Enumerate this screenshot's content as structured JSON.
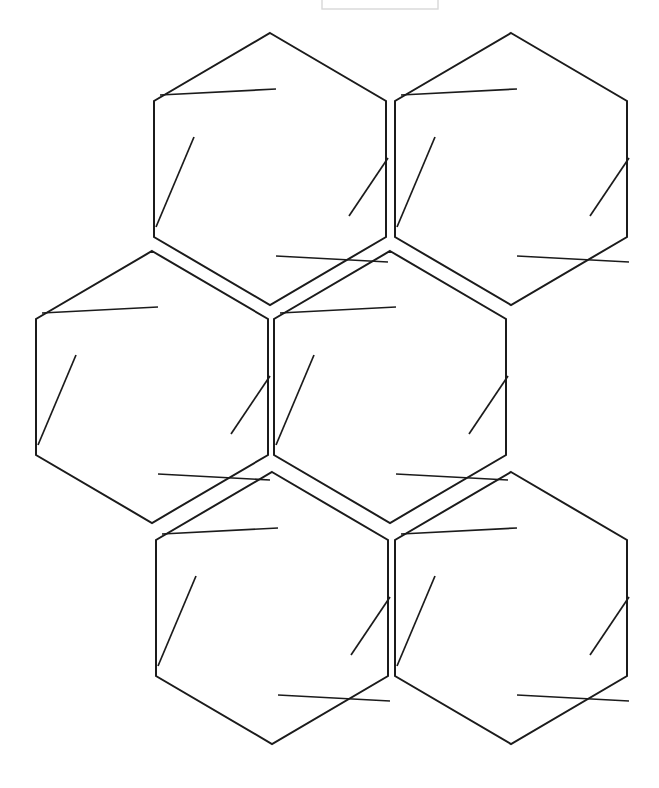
{
  "document": {
    "title": "Hexagon Grid Worksheet",
    "background_color": "#ffffff",
    "width": 659,
    "height": 788,
    "stroke_color": "#1b1b1b",
    "stroke_width": 2,
    "tick_stroke_width": 1.7
  },
  "header_box": {
    "label": "header-placeholder-box",
    "x": 322,
    "y": -6,
    "width": 116,
    "height": 15,
    "stroke_color": "#d8d8d8",
    "visible": true
  },
  "grid": {
    "type": "honeycomb",
    "orientation": "pointy-top",
    "hexagon_count": 6,
    "hex_width": 232,
    "hex_height": 272,
    "rows": 3,
    "row_labels": [
      "top-row",
      "middle-row",
      "bottom-row"
    ]
  },
  "hexagons": [
    {
      "id": "hex-1",
      "name": "hexagon-top-left",
      "row": 1,
      "column": 1,
      "cx": 270,
      "cy": 169,
      "rx": 116,
      "ry": 136,
      "ticks": [
        {
          "name": "tick-top-left-horizontal",
          "x1": 160,
          "y1": 95,
          "x2": 276,
          "y2": 89
        },
        {
          "name": "tick-left-diagonal",
          "x1": 156,
          "y1": 227,
          "x2": 194,
          "y2": 137
        },
        {
          "name": "tick-right-diagonal",
          "x1": 349,
          "y1": 216,
          "x2": 388,
          "y2": 158
        },
        {
          "name": "tick-bottom-horizontal",
          "x1": 276,
          "y1": 256,
          "x2": 388,
          "y2": 262
        }
      ]
    },
    {
      "id": "hex-2",
      "name": "hexagon-top-right",
      "row": 1,
      "column": 2,
      "cx": 511,
      "cy": 169,
      "rx": 116,
      "ry": 136,
      "ticks": [
        {
          "name": "tick-top-left-horizontal",
          "x1": 401,
          "y1": 95,
          "x2": 517,
          "y2": 89
        },
        {
          "name": "tick-left-diagonal",
          "x1": 397,
          "y1": 227,
          "x2": 435,
          "y2": 137
        },
        {
          "name": "tick-right-diagonal",
          "x1": 590,
          "y1": 216,
          "x2": 629,
          "y2": 158
        },
        {
          "name": "tick-bottom-horizontal",
          "x1": 517,
          "y1": 256,
          "x2": 629,
          "y2": 262
        }
      ]
    },
    {
      "id": "hex-3",
      "name": "hexagon-middle-left",
      "row": 2,
      "column": 1,
      "cx": 152,
      "cy": 387,
      "rx": 116,
      "ry": 136,
      "ticks": [
        {
          "name": "tick-top-left-horizontal",
          "x1": 42,
          "y1": 313,
          "x2": 158,
          "y2": 307
        },
        {
          "name": "tick-left-diagonal",
          "x1": 38,
          "y1": 445,
          "x2": 76,
          "y2": 355
        },
        {
          "name": "tick-right-diagonal",
          "x1": 231,
          "y1": 434,
          "x2": 270,
          "y2": 376
        },
        {
          "name": "tick-bottom-horizontal",
          "x1": 158,
          "y1": 474,
          "x2": 270,
          "y2": 480
        }
      ]
    },
    {
      "id": "hex-4",
      "name": "hexagon-middle-center",
      "row": 2,
      "column": 2,
      "cx": 390,
      "cy": 387,
      "rx": 116,
      "ry": 136,
      "ticks": [
        {
          "name": "tick-top-left-horizontal",
          "x1": 280,
          "y1": 313,
          "x2": 396,
          "y2": 307
        },
        {
          "name": "tick-left-diagonal",
          "x1": 276,
          "y1": 445,
          "x2": 314,
          "y2": 355
        },
        {
          "name": "tick-right-diagonal",
          "x1": 469,
          "y1": 434,
          "x2": 508,
          "y2": 376
        },
        {
          "name": "tick-bottom-horizontal",
          "x1": 396,
          "y1": 474,
          "x2": 508,
          "y2": 480
        }
      ]
    },
    {
      "id": "hex-5",
      "name": "hexagon-bottom-left",
      "row": 3,
      "column": 1,
      "cx": 272,
      "cy": 608,
      "rx": 116,
      "ry": 136,
      "ticks": [
        {
          "name": "tick-top-left-horizontal",
          "x1": 162,
          "y1": 534,
          "x2": 278,
          "y2": 528
        },
        {
          "name": "tick-left-diagonal",
          "x1": 158,
          "y1": 666,
          "x2": 196,
          "y2": 576
        },
        {
          "name": "tick-right-diagonal",
          "x1": 351,
          "y1": 655,
          "x2": 390,
          "y2": 597
        },
        {
          "name": "tick-bottom-horizontal",
          "x1": 278,
          "y1": 695,
          "x2": 390,
          "y2": 701
        }
      ]
    },
    {
      "id": "hex-6",
      "name": "hexagon-bottom-right",
      "row": 3,
      "column": 2,
      "cx": 511,
      "cy": 608,
      "rx": 116,
      "ry": 136,
      "ticks": [
        {
          "name": "tick-top-left-horizontal",
          "x1": 401,
          "y1": 534,
          "x2": 517,
          "y2": 528
        },
        {
          "name": "tick-left-diagonal",
          "x1": 397,
          "y1": 666,
          "x2": 435,
          "y2": 576
        },
        {
          "name": "tick-right-diagonal",
          "x1": 590,
          "y1": 655,
          "x2": 629,
          "y2": 597
        },
        {
          "name": "tick-bottom-horizontal",
          "x1": 517,
          "y1": 695,
          "x2": 629,
          "y2": 701
        }
      ]
    }
  ]
}
